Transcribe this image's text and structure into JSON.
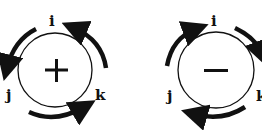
{
  "diagrams": [
    {
      "sign": "+",
      "rotation": "counterclockwise",
      "labels": {
        "top": "i",
        "left": "j",
        "right": "k"
      }
    },
    {
      "sign": "−",
      "rotation": "clockwise",
      "labels": {
        "top": "i",
        "left": "j",
        "right": "k"
      }
    }
  ],
  "colors": {
    "ink": "#111111",
    "background": "#ffffff"
  }
}
